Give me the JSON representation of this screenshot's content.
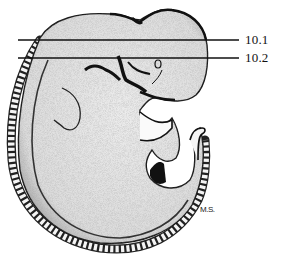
{
  "figure": {
    "section_lines": [
      {
        "label": "10.1",
        "y": 40,
        "x1": 18,
        "x2": 239
      },
      {
        "label": "10.2",
        "y": 58,
        "x1": 18,
        "x2": 239
      }
    ],
    "signature": "M.S.",
    "colors": {
      "ink": "#111111",
      "stipple_fill": "#e6e6e6",
      "background": "#ffffff"
    }
  }
}
